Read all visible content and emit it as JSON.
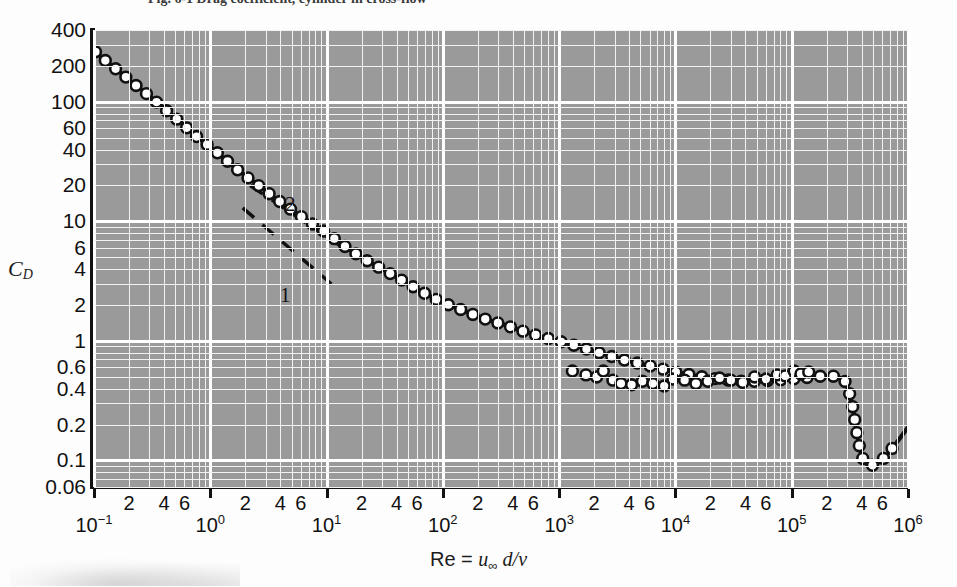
{
  "figure": {
    "caption": "Fig. 6-1   Drag coefficient, cylinder in cross-flow as a function of Reynolds number",
    "caption_visible_fragment": "Fig. 6-1   Drag coefficient, cylinder in cross-flow",
    "y_axis_title_main": "C",
    "y_axis_title_sub": "D",
    "x_axis_title_prefix": "Re = ",
    "x_axis_title_u": "u",
    "x_axis_title_u_sub": "∞",
    "x_axis_title_rest": " d/",
    "x_axis_title_nu": "ν"
  },
  "colors": {
    "plot_background": "#9a9a9a",
    "gridline_major": "#ffffff",
    "gridline_minor": "#f2f2f2",
    "axis": "#111111",
    "curve": "#111111",
    "marker_fill": "#ffffff",
    "page_background": "#fdfdfd"
  },
  "annotations": [
    {
      "label": "2",
      "x_px": 285,
      "y_px": 192
    },
    {
      "label": "1",
      "x_px": 280,
      "y_px": 283
    }
  ],
  "chart_data": {
    "type": "line",
    "xlabel": "Re = u∞ d/ν",
    "ylabel": "C_D",
    "xscale": "log",
    "yscale": "log",
    "xlim": [
      0.1,
      1000000
    ],
    "ylim": [
      0.06,
      400
    ],
    "grid": true,
    "legend": false,
    "x_major_ticks": [
      "10⁻¹",
      "10⁰",
      "10¹",
      "10²",
      "10³",
      "10⁴",
      "10⁵",
      "10⁶"
    ],
    "x_major_values": [
      0.1,
      1,
      10,
      100,
      1000,
      10000,
      100000,
      1000000
    ],
    "x_minor_ticks": [
      "2",
      "4",
      "6"
    ],
    "y_tick_labels": [
      "400",
      "200",
      "100",
      "60",
      "40",
      "20",
      "10",
      "6",
      "4",
      "2",
      "1",
      "0.6",
      "0.4",
      "0.2",
      "0.1",
      "0.06"
    ],
    "y_tick_values": [
      400,
      200,
      100,
      60,
      40,
      20,
      10,
      6,
      4,
      2,
      1,
      0.6,
      0.4,
      0.2,
      0.1,
      0.06
    ],
    "series": [
      {
        "name": "C_D (cylinder, measured)",
        "marker": "open-circle",
        "x": [
          0.1,
          0.13,
          0.17,
          0.22,
          0.3,
          0.4,
          0.55,
          0.75,
          1.0,
          1.4,
          1.9,
          2.6,
          3.5,
          5.0,
          7.0,
          10,
          14,
          20,
          30,
          45,
          70,
          100,
          150,
          220,
          350,
          500,
          800,
          1200,
          2000,
          3500,
          6000,
          10000,
          20000,
          40000,
          70000,
          100000,
          150000,
          200000,
          250000,
          280000,
          300000,
          330000,
          360000,
          400000,
          450000,
          550000,
          700000,
          1000000
        ],
        "y": [
          270,
          215,
          175,
          142,
          112,
          88,
          68,
          52,
          42,
          32,
          25,
          20,
          16,
          12.5,
          10.0,
          8.0,
          6.3,
          5.0,
          4.0,
          3.2,
          2.5,
          2.1,
          1.8,
          1.55,
          1.35,
          1.2,
          1.05,
          0.95,
          0.82,
          0.7,
          0.62,
          0.55,
          0.49,
          0.46,
          0.47,
          0.48,
          0.5,
          0.51,
          0.5,
          0.47,
          0.42,
          0.3,
          0.18,
          0.11,
          0.092,
          0.095,
          0.12,
          0.19
        ]
      }
    ],
    "reference_lines": [
      {
        "name": "slope -2 (Stokes-like steep asymptote)",
        "label": "2",
        "style": "dashed",
        "x_start": 2.2,
        "y_start": 20.0,
        "x_end": 13.0,
        "y_end": 6.3
      },
      {
        "name": "slope -1 (Stokes drag C_D = 24/Re)",
        "label": "1",
        "style": "dashed",
        "x_start": 1.9,
        "y_start": 13.0,
        "x_end": 11.0,
        "y_end": 3.0
      }
    ]
  }
}
